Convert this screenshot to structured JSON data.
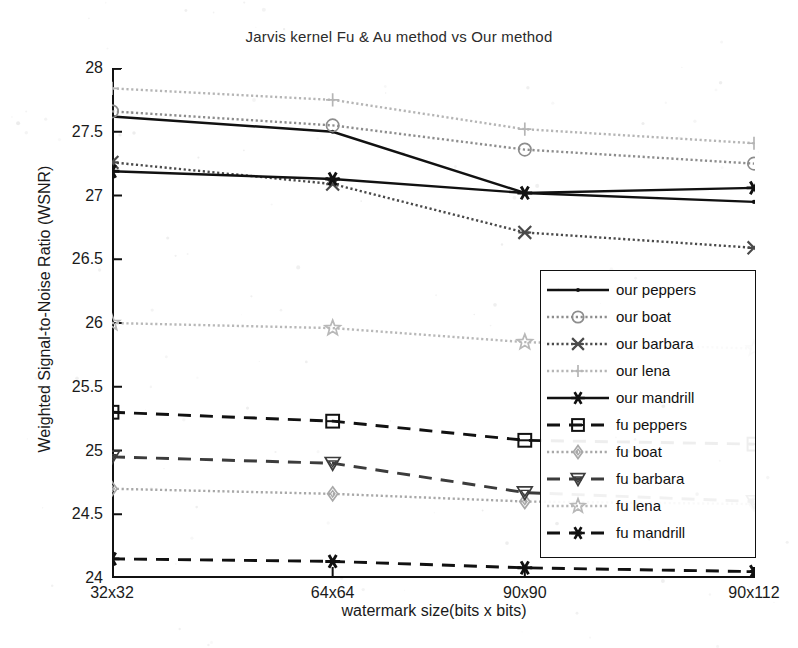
{
  "chart_data": {
    "type": "line",
    "title": "Jarvis kernel Fu & Au method vs Our method",
    "xlabel": "watermark size(bits x bits)",
    "ylabel": "Weighted Signal-to-Noise Ratio (WSNR)",
    "categories": [
      "32x32",
      "64x64",
      "90x90",
      "90x112"
    ],
    "xticklabels": [
      "32x32",
      "64x64",
      "90x90",
      "90x112"
    ],
    "yticklabels": [
      "28",
      "27.5",
      "27",
      "26.5",
      "26",
      "25.5",
      "25",
      "24.5",
      "24"
    ],
    "ytickvalues": [
      28,
      27.5,
      27,
      26.5,
      26,
      25.5,
      25,
      24.5,
      24
    ],
    "ylim": [
      24,
      28
    ],
    "grid": false,
    "legend_position": "lower right (inside axes)",
    "series": [
      {
        "name": "our peppers",
        "key": "our_peppers",
        "style": "solid",
        "marker": "dot",
        "color": "#111111",
        "values": [
          27.62,
          27.5,
          27.02,
          26.95
        ]
      },
      {
        "name": "our boat",
        "key": "our_boat",
        "style": "dotted",
        "marker": "circle",
        "color": "#8d8d8d",
        "values": [
          27.66,
          27.55,
          27.36,
          27.25
        ]
      },
      {
        "name": "our barbara",
        "key": "our_barbara",
        "style": "dotted",
        "marker": "cross-star",
        "color": "#4a4a4a",
        "values": [
          27.26,
          27.09,
          26.71,
          26.59
        ]
      },
      {
        "name": "our lena",
        "key": "our_lena",
        "style": "dotted",
        "marker": "plus",
        "color": "#b5b5b5",
        "values": [
          27.84,
          27.75,
          27.52,
          27.41
        ]
      },
      {
        "name": "our mandrill",
        "key": "our_mandrill",
        "style": "solid",
        "marker": "star6",
        "color": "#111111",
        "values": [
          27.19,
          27.13,
          27.02,
          27.06
        ]
      },
      {
        "name": "fu peppers",
        "key": "fu_peppers",
        "style": "dashed",
        "marker": "square-h",
        "color": "#111111",
        "values": [
          25.3,
          25.23,
          25.08,
          25.05
        ]
      },
      {
        "name": "fu boat",
        "key": "fu_boat",
        "style": "dotted",
        "marker": "diamond",
        "color": "#a8a8a8",
        "values": [
          24.7,
          24.66,
          24.6,
          24.58
        ]
      },
      {
        "name": "fu barbara",
        "key": "fu_barbara",
        "style": "dashed",
        "marker": "tri-down",
        "color": "#3c3c3c",
        "values": [
          24.95,
          24.9,
          24.67,
          24.6
        ]
      },
      {
        "name": "fu lena",
        "key": "fu_lena",
        "style": "dotted",
        "marker": "star5",
        "color": "#b8b8b8",
        "values": [
          26.0,
          25.96,
          25.85,
          25.8
        ]
      },
      {
        "name": "fu mandrill",
        "key": "fu_mandrill",
        "style": "dashed",
        "marker": "star6",
        "color": "#111111",
        "values": [
          24.15,
          24.13,
          24.08,
          24.05
        ]
      }
    ]
  },
  "legend": {
    "items": [
      {
        "label": "our peppers"
      },
      {
        "label": "our boat"
      },
      {
        "label": "our barbara"
      },
      {
        "label": "our lena"
      },
      {
        "label": "our mandrill"
      },
      {
        "label": "fu peppers"
      },
      {
        "label": "fu boat"
      },
      {
        "label": "fu barbara"
      },
      {
        "label": "fu lena"
      },
      {
        "label": "fu mandrill"
      }
    ]
  }
}
